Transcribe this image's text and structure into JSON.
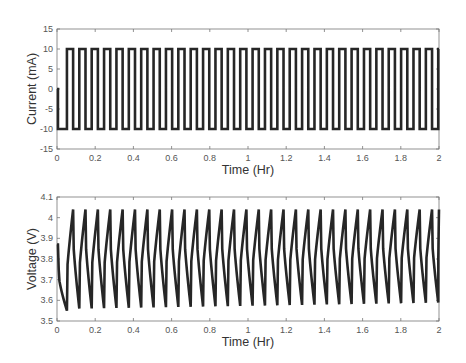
{
  "chart_data": [
    {
      "type": "line",
      "title": "",
      "xlabel": "Time (Hr)",
      "ylabel": "Current (mA)",
      "xlim": [
        0,
        2
      ],
      "ylim": [
        -15,
        15
      ],
      "xticks": [
        0,
        0.2,
        0.4,
        0.6,
        0.8,
        1,
        1.2,
        1.4,
        1.6,
        1.8,
        2
      ],
      "xtick_labels": [
        "0",
        "0.2",
        "0.4",
        "0.6",
        "0.8",
        "1",
        "1.2",
        "1.4",
        "1.6",
        "1.8",
        "2"
      ],
      "yticks": [
        -15,
        -10,
        -5,
        0,
        5,
        10,
        15
      ],
      "ytick_labels": [
        "-15",
        "-10",
        "-5",
        "0",
        "5",
        "10",
        "15"
      ],
      "grid": false,
      "legend": null,
      "line_color": "#262626",
      "series": [
        {
          "name": "current",
          "description": "Square wave: 0 mA at t=0, -10 mA from ~0.005 to ~0.052 hr, then alternating +10/-10 mA with ~0.065 hr period (~31 cycles) up to 2 hr",
          "initial": {
            "t_start": 0,
            "t_end": 0.005,
            "value": 0
          },
          "rest_discharge": {
            "t_start": 0.005,
            "t_end": 0.052,
            "value": -10
          },
          "square_wave": {
            "t_start": 0.052,
            "t_end": 2.0,
            "period": 0.0648,
            "high": 10,
            "low": -10,
            "duty": 0.5
          }
        }
      ]
    },
    {
      "type": "line",
      "title": "",
      "xlabel": "Time (Hr)",
      "ylabel": "Voltage (V)",
      "xlim": [
        0,
        2
      ],
      "ylim": [
        3.5,
        4.1
      ],
      "xticks": [
        0,
        0.2,
        0.4,
        0.6,
        0.8,
        1,
        1.2,
        1.4,
        1.6,
        1.8,
        2
      ],
      "xtick_labels": [
        "0",
        "0.2",
        "0.4",
        "0.6",
        "0.8",
        "1",
        "1.2",
        "1.4",
        "1.6",
        "1.8",
        "2"
      ],
      "yticks": [
        3.5,
        3.6,
        3.7,
        3.8,
        3.9,
        4.0,
        4.1
      ],
      "ytick_labels": [
        "3.5",
        "3.6",
        "3.7",
        "3.8",
        "3.9",
        "4",
        "4.1"
      ],
      "grid": false,
      "legend": null,
      "line_color": "#262626",
      "series": [
        {
          "name": "voltage",
          "description": "Sawtooth-like response: starts at 3.87 V, drops to ~3.55 V by 0.052 hr, then charges to ~4.04 V and discharges to ~3.57 V each cycle, ending near 3.95 V at 2 hr",
          "initial": {
            "t_start": 0,
            "t_end": 0.005,
            "value": 3.87
          },
          "first_min": 3.55,
          "cycle_peak": 4.04,
          "cycle_trough_start": 3.56,
          "cycle_trough_end": 3.59,
          "period": 0.0648,
          "end_value": 3.96
        }
      ]
    }
  ]
}
